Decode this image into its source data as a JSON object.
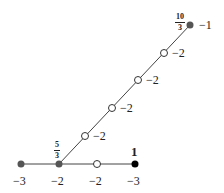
{
  "diagram": {
    "type": "weighted-graph",
    "edges": [
      {
        "from": "n0",
        "to": "n1"
      },
      {
        "from": "n1",
        "to": "n2"
      },
      {
        "from": "n2",
        "to": "n3"
      },
      {
        "from": "n1",
        "to": "d1"
      },
      {
        "from": "d1",
        "to": "d2"
      },
      {
        "from": "d2",
        "to": "d3"
      },
      {
        "from": "d3",
        "to": "d4"
      },
      {
        "from": "d4",
        "to": "top"
      }
    ],
    "nodes": {
      "n0": {
        "weight": "−3",
        "style": "filled-gray"
      },
      "n1": {
        "weight": "−2",
        "style": "filled-gray",
        "annotation_num": "5",
        "annotation_den": "3"
      },
      "n2": {
        "weight": "−2",
        "style": "open"
      },
      "n3": {
        "weight": "−3",
        "style": "filled-black",
        "annotation": "1"
      },
      "d1": {
        "weight": "−2",
        "style": "open"
      },
      "d2": {
        "weight": "−2",
        "style": "open"
      },
      "d3": {
        "weight": "−2",
        "style": "open"
      },
      "d4": {
        "weight": "−2",
        "style": "open"
      },
      "top": {
        "weight": "−1",
        "style": "filled-gray",
        "annotation_num": "10",
        "annotation_den": "3"
      }
    },
    "colors": {
      "gray_node": "#555555",
      "black_node": "#000000",
      "edge": "#444444"
    }
  }
}
